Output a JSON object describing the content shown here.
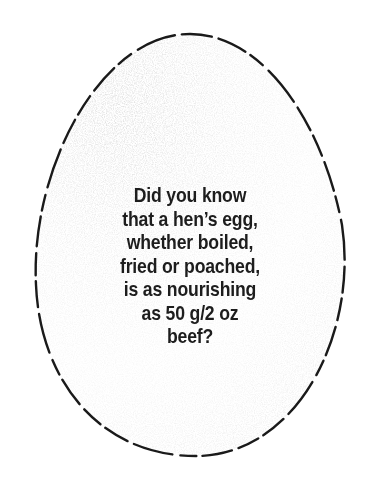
{
  "illustration": {
    "shape": "egg-outline-dashed",
    "outline_color": "#1a1a1a",
    "shading_color": "#9a9a9a"
  },
  "fact": {
    "lines": [
      "Did you know",
      "that a hen’s egg,",
      "whether boiled,",
      "fried or poached,",
      "is as nourishing",
      "as 50 g/2 oz",
      "beef?"
    ]
  }
}
